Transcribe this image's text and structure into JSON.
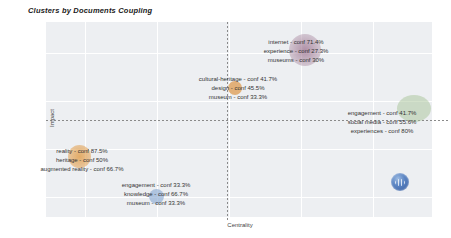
{
  "figure": {
    "title": "Clusters by Documents Coupling",
    "x_axis_label": "Centrality",
    "y_axis_label": "Impact"
  },
  "colors": {
    "plot_background": "#edeff2",
    "gridline": "#ffffff",
    "dashed_divider": "#8a8a8a",
    "label_text": "#333333",
    "bubble_purple": "#a5849b",
    "bubble_orange": "#dd9646",
    "bubble_green": "#a8c398",
    "bubble_blue": "#8caad2",
    "logo_blue": "#33589b"
  },
  "icons": {
    "watermark": "blue-globe-logo-icon"
  },
  "chart_data": {
    "type": "scatter",
    "title": "Clusters by Documents Coupling",
    "xlabel": "Centrality",
    "ylabel": "Impact",
    "axis_ticks": "none (unlabeled quadrant map)",
    "grid": "on",
    "divider_lines": "dashed vertical at mid-centrality, dashed horizontal at mid-impact",
    "clusters": [
      {
        "name": "internet-experience-museums",
        "bubble_color": "#a5849b",
        "quadrant": "high impact, right of center divider",
        "items": [
          {
            "label": "internet",
            "conf": "71.4%"
          },
          {
            "label": "experience",
            "conf": "27.3%"
          },
          {
            "label": "museums",
            "conf": "30%"
          }
        ],
        "lines": [
          "internet - conf 71.4%",
          "experience - conf 27.3%",
          "museums - conf 30%"
        ]
      },
      {
        "name": "cultural-heritage-design-museum",
        "bubble_color": "#dd9646",
        "quadrant": "upper half, on center divider",
        "items": [
          {
            "label": "cultural-heritage",
            "conf": "41.7%"
          },
          {
            "label": "design",
            "conf": "45.5%"
          },
          {
            "label": "museum",
            "conf": "33.3%"
          }
        ],
        "lines": [
          "cultural-heritage - conf 41.7%",
          "design - conf 45.5%",
          "museum - conf 33.3%"
        ]
      },
      {
        "name": "engagement-social-media-experiences",
        "bubble_color": "#a8c398",
        "quadrant": "high centrality, on impact divider",
        "items": [
          {
            "label": "engagement",
            "conf": "41.7%"
          },
          {
            "label": "social media",
            "conf": "55.6%"
          },
          {
            "label": "experiences",
            "conf": "80%"
          }
        ],
        "lines": [
          "engagement - conf 41.7%",
          "social media - conf 55.6%",
          "experiences - conf 80%"
        ]
      },
      {
        "name": "reality-heritage-augmented-reality",
        "bubble_color": "#dd9646",
        "quadrant": "low impact, low centrality",
        "items": [
          {
            "label": "reality",
            "conf": "87.5%"
          },
          {
            "label": "heritage",
            "conf": "50%"
          },
          {
            "label": "augmented reality",
            "conf": "66.7%"
          }
        ],
        "lines": [
          "reality - conf 87.5%",
          "heritage - conf 50%",
          "augmented reality - conf 66.7%"
        ]
      },
      {
        "name": "engagement-knowledge-museum",
        "bubble_color": "#8caad2",
        "quadrant": "low impact, low centrality",
        "items": [
          {
            "label": "engagement",
            "conf": "33.3%"
          },
          {
            "label": "knowledge",
            "conf": "66.7%"
          },
          {
            "label": "museum",
            "conf": "33.3%"
          }
        ],
        "lines": [
          "engagement - conf 33.3%",
          "knowledge - conf 66.7%",
          "museum - conf 33.3%"
        ]
      }
    ]
  }
}
